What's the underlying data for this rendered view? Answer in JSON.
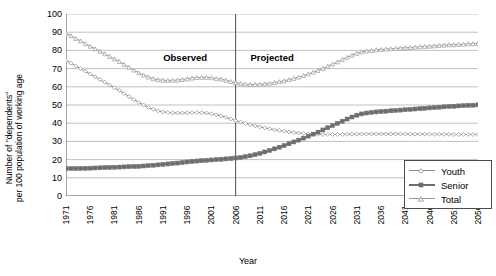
{
  "chart_data": {
    "type": "line",
    "title": "",
    "xlabel": "Year",
    "ylabel": "Number of \"dependents\"\nper 100 population of working age",
    "ylim": [
      0,
      100
    ],
    "ytick_step": 10,
    "yticks": [
      100,
      90,
      80,
      70,
      60,
      50,
      40,
      30,
      20,
      10,
      0
    ],
    "xlim": [
      1971,
      2056
    ],
    "xticks": [
      1971,
      1976,
      1981,
      1986,
      1991,
      1996,
      2001,
      2006,
      2011,
      2016,
      2021,
      2026,
      2031,
      2036,
      2041,
      2046,
      2051,
      2056
    ],
    "grid": "horizontal",
    "legend_position": "bottom-right",
    "annotations": [
      {
        "text": "Observed",
        "x": 1996,
        "y": 76
      },
      {
        "text": "Projected",
        "x": 2014,
        "y": 76
      }
    ],
    "divider_x": 2006,
    "x": [
      1971,
      1972,
      1973,
      1974,
      1975,
      1976,
      1977,
      1978,
      1979,
      1980,
      1981,
      1982,
      1983,
      1984,
      1985,
      1986,
      1987,
      1988,
      1989,
      1990,
      1991,
      1992,
      1993,
      1994,
      1995,
      1996,
      1997,
      1998,
      1999,
      2000,
      2001,
      2002,
      2003,
      2004,
      2005,
      2006,
      2007,
      2008,
      2009,
      2010,
      2011,
      2012,
      2013,
      2014,
      2015,
      2016,
      2017,
      2018,
      2019,
      2020,
      2021,
      2022,
      2023,
      2024,
      2025,
      2026,
      2027,
      2028,
      2029,
      2030,
      2031,
      2032,
      2033,
      2034,
      2035,
      2036,
      2037,
      2038,
      2039,
      2040,
      2041,
      2042,
      2043,
      2044,
      2045,
      2046,
      2047,
      2048,
      2049,
      2050,
      2051,
      2052,
      2053,
      2054,
      2055,
      2056
    ],
    "series": [
      {
        "name": "Youth",
        "marker": "diamond",
        "color": "#8c8c8c",
        "values": [
          74.5,
          73.0,
          71.5,
          70.0,
          68.5,
          67.0,
          65.5,
          64.0,
          62.5,
          61.0,
          59.5,
          58.0,
          56.3,
          54.6,
          53.0,
          51.4,
          50.0,
          48.7,
          47.6,
          46.8,
          46.2,
          45.9,
          45.7,
          45.6,
          45.6,
          45.7,
          45.8,
          45.9,
          45.8,
          45.6,
          45.2,
          44.6,
          44.0,
          43.2,
          42.3,
          41.4,
          40.6,
          39.9,
          39.2,
          38.6,
          38.0,
          37.4,
          36.9,
          36.4,
          36.0,
          35.6,
          35.2,
          34.9,
          34.6,
          34.4,
          34.2,
          34.0,
          33.9,
          33.8,
          33.8,
          33.8,
          33.8,
          33.9,
          33.9,
          34.0,
          34.0,
          34.1,
          34.1,
          34.1,
          34.1,
          34.1,
          34.1,
          34.1,
          34.1,
          34.1,
          34.1,
          34.0,
          34.0,
          34.0,
          34.0,
          33.9,
          33.9,
          33.9,
          33.9,
          33.9,
          33.8,
          33.8,
          33.8,
          33.8,
          33.8,
          33.8
        ]
      },
      {
        "name": "Senior",
        "marker": "square",
        "color": "#6e6e6e",
        "values": [
          15.0,
          15.1,
          15.1,
          15.2,
          15.2,
          15.3,
          15.4,
          15.5,
          15.6,
          15.7,
          15.8,
          15.9,
          16.0,
          16.1,
          16.2,
          16.3,
          16.5,
          16.7,
          16.9,
          17.1,
          17.4,
          17.6,
          17.9,
          18.1,
          18.4,
          18.7,
          19.0,
          19.2,
          19.4,
          19.6,
          19.8,
          20.0,
          20.2,
          20.4,
          20.6,
          20.9,
          21.2,
          21.6,
          22.1,
          22.7,
          23.4,
          24.2,
          25.0,
          25.9,
          26.8,
          27.7,
          28.7,
          29.7,
          30.7,
          31.8,
          32.9,
          34.0,
          35.1,
          36.3,
          37.5,
          38.7,
          39.9,
          41.1,
          42.3,
          43.4,
          44.4,
          45.1,
          45.6,
          45.9,
          46.2,
          46.4,
          46.6,
          46.8,
          47.0,
          47.2,
          47.4,
          47.6,
          47.8,
          48.0,
          48.2,
          48.4,
          48.6,
          48.8,
          49.0,
          49.2,
          49.3,
          49.5,
          49.6,
          49.8,
          49.9,
          50.1
        ]
      },
      {
        "name": "Total",
        "marker": "triangle",
        "color": "#9a9a9a",
        "values": [
          89.5,
          88.1,
          86.6,
          85.2,
          83.7,
          82.3,
          80.9,
          79.5,
          78.1,
          76.7,
          75.3,
          73.9,
          72.3,
          70.7,
          69.2,
          67.7,
          66.5,
          65.4,
          64.5,
          63.9,
          63.6,
          63.5,
          63.6,
          63.7,
          64.0,
          64.4,
          64.8,
          65.1,
          65.2,
          65.2,
          65.0,
          64.6,
          64.2,
          63.6,
          62.9,
          62.3,
          61.8,
          61.5,
          61.3,
          61.3,
          61.4,
          61.6,
          61.9,
          62.3,
          62.8,
          63.3,
          63.9,
          64.6,
          65.3,
          66.2,
          67.1,
          68.0,
          69.0,
          70.1,
          71.3,
          72.5,
          73.7,
          75.0,
          76.2,
          77.4,
          78.4,
          79.2,
          79.7,
          80.0,
          80.3,
          80.5,
          80.7,
          80.9,
          81.1,
          81.3,
          81.5,
          81.6,
          81.8,
          82.0,
          82.2,
          82.3,
          82.5,
          82.7,
          82.9,
          83.1,
          83.1,
          83.3,
          83.4,
          83.6,
          83.7,
          83.9
        ]
      }
    ],
    "legend": [
      {
        "label": "Youth",
        "marker": "diamond"
      },
      {
        "label": "Senior",
        "marker": "square"
      },
      {
        "label": "Total",
        "marker": "triangle"
      }
    ]
  }
}
